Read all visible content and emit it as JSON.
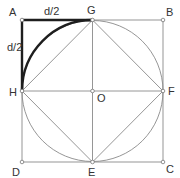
{
  "diagram": {
    "labels": {
      "A": "A",
      "B": "B",
      "C": "C",
      "D": "D",
      "E": "E",
      "F": "F",
      "G": "G",
      "H": "H",
      "O": "O",
      "top_dim": "d/2",
      "left_dim": "d/2"
    },
    "points": {
      "A": [
        22,
        20
      ],
      "B": [
        163,
        20
      ],
      "C": [
        163,
        162
      ],
      "D": [
        22,
        162
      ],
      "G": [
        92.5,
        20
      ],
      "F": [
        163,
        91
      ],
      "E": [
        92.5,
        162
      ],
      "H": [
        22,
        91
      ],
      "O": [
        92.5,
        91
      ]
    },
    "circle": {
      "center": "O",
      "radius": 70.5
    },
    "highlighted": [
      "segment A-G",
      "segment A-H",
      "arc H-G"
    ],
    "colors": {
      "thin_line": "#8a8a8a",
      "thick_line": "#1e1e1e",
      "label": "#333333",
      "background": "#ffffff"
    }
  }
}
